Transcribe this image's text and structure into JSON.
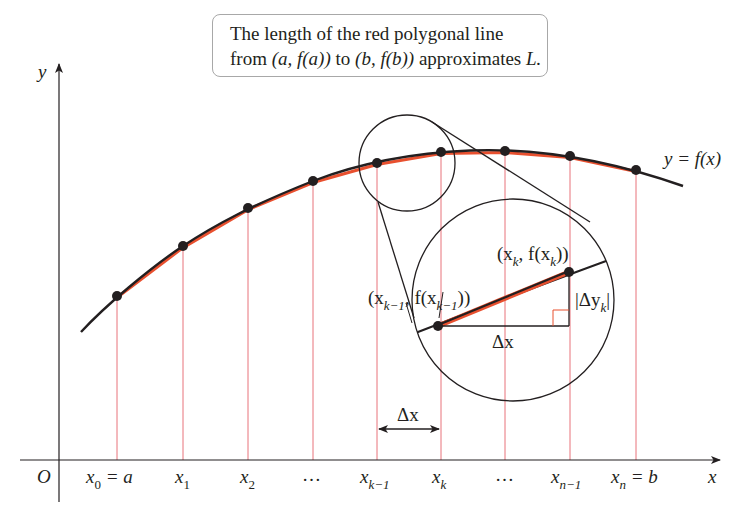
{
  "caption": {
    "line1": "The length of the red polygonal line",
    "line2_prefix": "from ",
    "line2_pt1": "(a, f(a))",
    "line2_mid": " to ",
    "line2_pt2": "(b, f(b))",
    "line2_suffix": " approximates ",
    "line2_var": "L."
  },
  "axes": {
    "origin_label": "O",
    "x_label": "x",
    "y_label": "y"
  },
  "curve_label": "y = f(x)",
  "x_ticks": [
    {
      "base": "x",
      "sub": "0",
      "suffix": " = a"
    },
    {
      "base": "x",
      "sub": "1",
      "suffix": ""
    },
    {
      "base": "x",
      "sub": "2",
      "suffix": ""
    },
    {
      "base": "…",
      "sub": "",
      "suffix": ""
    },
    {
      "base": "x",
      "sub": "k−1",
      "suffix": ""
    },
    {
      "base": "x",
      "sub": "k",
      "suffix": ""
    },
    {
      "base": "…",
      "sub": "",
      "suffix": ""
    },
    {
      "base": "x",
      "sub": "n−1",
      "suffix": ""
    },
    {
      "base": "x",
      "sub": "n",
      "suffix": " = b"
    }
  ],
  "delta_x_label": "Δx",
  "zoom_inset": {
    "point_prev_label": "(x_{k−1}, f(x_{k−1}))",
    "point_prev_base": "(x",
    "point_prev_sub1": "k−1",
    "point_prev_mid": ", f(x",
    "point_prev_sub2": "k−1",
    "point_prev_end": "))",
    "point_k_base": "(x",
    "point_k_sub1": "k",
    "point_k_mid": ", f(x",
    "point_k_sub2": "k",
    "point_k_end": "))",
    "dx_label": "Δx",
    "dy_label_base": "|Δy",
    "dy_label_sub": "k",
    "dy_label_end": "|"
  },
  "colors": {
    "curve": "#231f20",
    "polygon": "#e8502f",
    "gridline": "#e8727a",
    "box_border": "#a8a8a8"
  },
  "points_px": [
    [
      117,
      296
    ],
    [
      183,
      246
    ],
    [
      248,
      208
    ],
    [
      313,
      181
    ],
    [
      377,
      163
    ],
    [
      441,
      152
    ],
    [
      505,
      151
    ],
    [
      570,
      156
    ],
    [
      636,
      170
    ]
  ]
}
